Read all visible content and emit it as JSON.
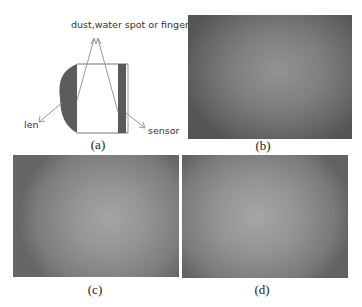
{
  "figure": {
    "panel_a": {
      "caption": "(a)",
      "labels": {
        "top": "dust,water spot or fingerprint",
        "lens": "len",
        "sensor": "sensor"
      }
    },
    "panel_b": {
      "caption": "(b)"
    },
    "panel_c": {
      "caption": "(c)"
    },
    "panel_d": {
      "caption": "(d)"
    }
  }
}
